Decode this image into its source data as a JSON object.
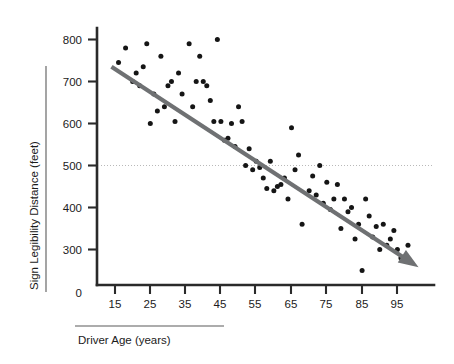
{
  "figure": {
    "background_color": "#ffffff",
    "point_color": "#151515",
    "trend_color": "#6f7173",
    "reference_line_color": "#b9b9b9",
    "axis_color": "#2a2a2a"
  },
  "axes": {
    "x_title": "Driver Age (years)",
    "y_title": "Sign Legibility Distance (feet)",
    "x_ticks": [
      "15",
      "25",
      "35",
      "45",
      "55",
      "65",
      "75",
      "85",
      "95"
    ],
    "y_ticks": [
      "0",
      "300",
      "400",
      "500",
      "600",
      "700",
      "800"
    ],
    "y_zero_label": "0"
  },
  "chart_data": {
    "type": "scatter",
    "title": "",
    "xlabel": "Driver Age (years)",
    "ylabel": "Sign Legibility Distance (feet)",
    "xlim": [
      10,
      102
    ],
    "ylim": [
      230,
      830
    ],
    "x_ticks": [
      15,
      25,
      35,
      45,
      55,
      65,
      75,
      85,
      95
    ],
    "y_ticks": [
      300,
      400,
      500,
      600,
      700,
      800
    ],
    "grid": false,
    "legend": null,
    "annotations": [
      {
        "kind": "reference-line",
        "orientation": "horizontal",
        "value": 500,
        "style": "dotted",
        "color": "#b9b9b9"
      },
      {
        "kind": "trend-line",
        "style": "solid-arrow",
        "color": "#6f7173",
        "x_start": 14,
        "y_start": 735,
        "x_end": 101,
        "y_end": 258,
        "description": "downward negative-slope regression arrow"
      }
    ],
    "series": [
      {
        "name": "Driver sign legibility observations",
        "marker": "filled-circle",
        "color": "#151515",
        "x": [
          16,
          18,
          20,
          21,
          22,
          23,
          24,
          25,
          26,
          27,
          28,
          29,
          30,
          31,
          32,
          33,
          34,
          36,
          37,
          38,
          39,
          40,
          41,
          42,
          43,
          44,
          45,
          46,
          47,
          48,
          49,
          50,
          51,
          52,
          53,
          54,
          55,
          56,
          57,
          58,
          59,
          60,
          61,
          62,
          63,
          64,
          65,
          66,
          67,
          68,
          70,
          71,
          72,
          73,
          74,
          75,
          76,
          77,
          78,
          79,
          80,
          81,
          82,
          83,
          84,
          85,
          86,
          87,
          88,
          89,
          90,
          91,
          92,
          93,
          94,
          95,
          96,
          97,
          98
        ],
        "y": [
          745,
          780,
          700,
          720,
          690,
          735,
          790,
          600,
          670,
          630,
          760,
          640,
          690,
          700,
          605,
          720,
          670,
          790,
          640,
          700,
          760,
          700,
          690,
          655,
          605,
          800,
          605,
          560,
          565,
          600,
          545,
          640,
          605,
          500,
          540,
          490,
          510,
          495,
          470,
          445,
          510,
          440,
          450,
          455,
          470,
          420,
          590,
          490,
          525,
          360,
          440,
          475,
          430,
          500,
          410,
          460,
          395,
          420,
          455,
          350,
          420,
          390,
          400,
          325,
          360,
          250,
          420,
          380,
          330,
          355,
          300,
          360,
          310,
          325,
          345,
          300,
          280,
          275,
          310
        ]
      }
    ]
  }
}
